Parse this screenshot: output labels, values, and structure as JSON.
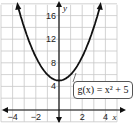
{
  "chart_data": {
    "type": "line",
    "title": "",
    "function_label": "g(x) = x² + 5",
    "xlabel": "x",
    "ylabel": "y",
    "xlim": [
      -5,
      5
    ],
    "ylim": [
      -2,
      18
    ],
    "x_ticks": [
      -4,
      -2,
      2,
      4
    ],
    "x_tick_labels": [
      "−4",
      "−2",
      "2",
      "4"
    ],
    "y_ticks": [
      4,
      8,
      12,
      16
    ],
    "y_tick_labels": [
      "4",
      "8",
      "12",
      "16"
    ],
    "grid": true,
    "series": [
      {
        "name": "g(x) = x² + 5",
        "x": [
          -3.6,
          -3,
          -2,
          -1,
          0,
          1,
          2,
          3,
          3.6
        ],
        "y": [
          17.96,
          14,
          9,
          6,
          5,
          6,
          9,
          14,
          17.96
        ]
      }
    ],
    "vertex": [
      0,
      5
    ],
    "colors": {
      "curve": "#111111",
      "grid": "#cccccc",
      "axes": "#111111"
    }
  }
}
